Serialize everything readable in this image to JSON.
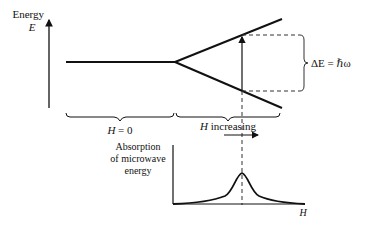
{
  "diagram": {
    "type": "zeeman-splitting-esr",
    "energy_axis": {
      "label": "Energy",
      "symbol": "E"
    },
    "regions": {
      "left": {
        "label_var": "H",
        "label_rest": " = 0"
      },
      "right": {
        "label_var": "H",
        "label_rest": " increasing"
      }
    },
    "energy_gap": {
      "label": "ΔE = ℏω"
    },
    "absorption_plot": {
      "ylabel_lines": [
        "Absorption",
        "of microwave",
        "energy"
      ],
      "xlabel": "H"
    },
    "colors": {
      "ink": "#111111",
      "background": "#ffffff"
    }
  }
}
